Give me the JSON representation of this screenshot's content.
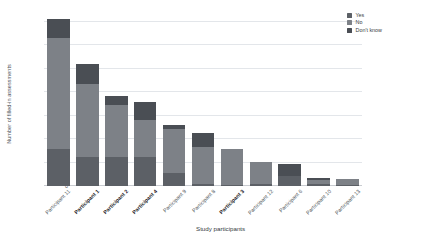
{
  "chart_data": {
    "type": "bar",
    "subtype": "stacked-vertical-bar",
    "title": "",
    "xlabel": "Study participants",
    "ylabel": "Number of filled-in assessments",
    "ylim": [
      0,
      350
    ],
    "ytick_values": [
      0,
      50,
      100,
      150,
      200,
      250,
      300,
      350
    ],
    "ytick_labels": [
      "0",
      "50",
      "100",
      "150",
      "200",
      "250",
      "300",
      "350"
    ],
    "grid": true,
    "grid_axis": "y",
    "legend_position": "top-right",
    "categories": [
      "Participant 11",
      "Participant 1",
      "Participant 2",
      "Participant 4",
      "Participant 9",
      "Participant 8",
      "Participant 3",
      "Participant 12",
      "Participant 6",
      "Participant 10",
      "Participant 13"
    ],
    "category_emphasis": [
      false,
      true,
      true,
      true,
      false,
      false,
      true,
      false,
      false,
      false,
      false
    ],
    "series": [
      {
        "name": "Yes",
        "color": "#5c6066",
        "values": [
          80,
          62,
          62,
          61,
          27,
          5,
          3,
          5,
          22,
          4,
          3
        ]
      },
      {
        "name": "No",
        "color": "#7d8187",
        "values": [
          235,
          155,
          110,
          80,
          95,
          78,
          75,
          47,
          0,
          9,
          12
        ]
      },
      {
        "name": "Don't know",
        "color": "#4a4e54",
        "values": [
          42,
          43,
          21,
          39,
          9,
          30,
          0,
          0,
          25,
          4,
          0
        ]
      }
    ],
    "totals": [
      357,
      260,
      193,
      180,
      131,
      113,
      78,
      52,
      47,
      17,
      15
    ]
  },
  "legend": {
    "items": [
      {
        "label": "Yes",
        "color": "#5c6066"
      },
      {
        "label": "No",
        "color": "#7d8187"
      },
      {
        "label": "Don't know",
        "color": "#4a4e54"
      }
    ]
  },
  "axes": {
    "y_title": "Number of filled-in assessments",
    "x_title": "Study participants"
  },
  "colors": {
    "background": "#ffffff",
    "grid": "#e3e6ea",
    "baseline": "#c9ccd1",
    "text": "#4a4f55"
  }
}
